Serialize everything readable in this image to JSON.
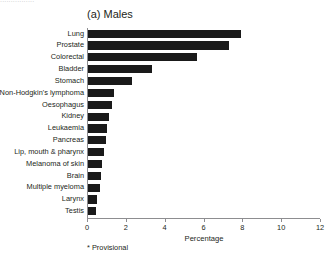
{
  "figure": {
    "title": "(a) Males",
    "footnote": "* Provisional",
    "bleed_top_text": "................"
  },
  "chart_data": {
    "type": "bar",
    "orientation": "horizontal",
    "title": "(a) Males",
    "xlabel": "Percentage",
    "ylabel": "",
    "xlim": [
      0,
      12
    ],
    "xticks": [
      "0",
      "2",
      "4",
      "6",
      "8",
      "10",
      "12"
    ],
    "xtick_values": [
      0,
      2,
      4,
      6,
      8,
      10,
      12
    ],
    "grid": false,
    "legend": null,
    "bar_color": "#1a1a1a",
    "axis_color": "#8d8d90",
    "categories": [
      "Lung",
      "Prostate",
      "Colorectal",
      "Bladder",
      "Stomach",
      "Non-Hodgkin's lymphoma",
      "Oesophagus",
      "Kidney",
      "Leukaemia",
      "Pancreas",
      "Lip, mouth & pharynx",
      "Melanoma of skin",
      "Brain",
      "Multiple myeloma",
      "Larynx",
      "Testis"
    ],
    "values": [
      7.9,
      7.25,
      5.6,
      3.3,
      2.25,
      1.35,
      1.25,
      1.1,
      1.0,
      0.95,
      0.8,
      0.7,
      0.68,
      0.6,
      0.45,
      0.4
    ],
    "annotations": [
      "* Provisional"
    ]
  }
}
